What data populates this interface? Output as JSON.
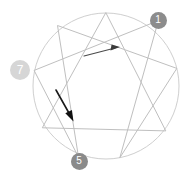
{
  "diagram": {
    "name": "enneagram-diagram",
    "type": "enneagram",
    "width": 185,
    "height": 176,
    "background": "#ffffff",
    "circle": {
      "cx": 106,
      "cy": 86,
      "r": 73,
      "stroke": "#cfcfcf",
      "stroke_width": 1,
      "fill": "none"
    },
    "line_stroke": "#bfbfbf",
    "line_stroke_width": 1,
    "points": [
      {
        "num": "1",
        "x": 158.4,
        "y": 20.6
      },
      {
        "num": "2",
        "x": 176.8,
        "y": 68.4
      },
      {
        "num": "3",
        "x": 165.8,
        "y": 130.9
      },
      {
        "num": "4",
        "x": 119.8,
        "y": 157.8
      },
      {
        "num": "5",
        "x": 78.5,
        "y": 157.1
      },
      {
        "num": "6",
        "x": 42.7,
        "y": 127.8
      },
      {
        "num": "7",
        "x": 34.1,
        "y": 70.4
      },
      {
        "num": "8",
        "x": 57.5,
        "y": 25.5
      },
      {
        "num": "9",
        "x": 106.0,
        "y": 13.0
      }
    ],
    "triangle_path": "9-3-6-9",
    "hexad_path": "1-4-2-8-5-7-1",
    "badges": [
      {
        "label": "1",
        "x": 158,
        "y": 20,
        "d": 17,
        "color": "#8c8c8c",
        "font_size": 10
      },
      {
        "label": "7",
        "x": 20,
        "y": 70,
        "d": 20,
        "color": "#d6d6d6",
        "font_size": 12
      },
      {
        "label": "5",
        "x": 79,
        "y": 161,
        "d": 17,
        "color": "#8a8a8a",
        "font_size": 10
      }
    ],
    "arrows": [
      {
        "name": "arrow-upper-right",
        "x1": 84,
        "y1": 56,
        "x2": 119,
        "y2": 47,
        "color": "#3b3b3b",
        "width": 1.2,
        "head_size": 7
      },
      {
        "name": "arrow-lower-left",
        "x1": 56,
        "y1": 90,
        "x2": 73,
        "y2": 121,
        "color": "#1a1a1a",
        "width": 1.6,
        "head_size": 8
      }
    ]
  }
}
